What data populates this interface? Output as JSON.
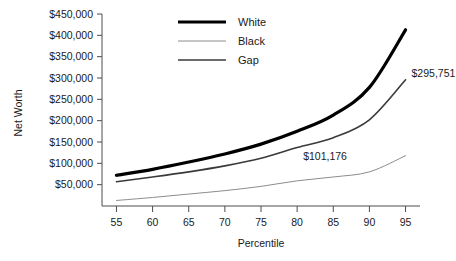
{
  "chart_data": {
    "type": "line",
    "title": "",
    "xlabel": "Percentile",
    "ylabel": "Net Worth",
    "x": [
      55,
      60,
      65,
      70,
      75,
      80,
      85,
      90,
      95
    ],
    "xlim": [
      53,
      97
    ],
    "ylim": [
      0,
      450000
    ],
    "xticks": [
      "55",
      "60",
      "65",
      "70",
      "75",
      "80",
      "85",
      "90",
      "95"
    ],
    "yticks": [
      "$50,000",
      "$100,000",
      "$150,000",
      "$200,000",
      "$250,000",
      "$300,000",
      "$350,000",
      "$400,000",
      "$450,000"
    ],
    "ytick_values": [
      50000,
      100000,
      150000,
      200000,
      250000,
      300000,
      350000,
      400000,
      450000
    ],
    "grid": false,
    "legend_position": "top-center",
    "series": [
      {
        "name": "White",
        "color": "#000000",
        "width": 3.2,
        "values": [
          72000,
          86000,
          103000,
          122000,
          145000,
          175000,
          213000,
          278000,
          413000
        ]
      },
      {
        "name": "Black",
        "color": "#8c8c8c",
        "width": 1.0,
        "values": [
          13000,
          20000,
          28000,
          36000,
          46000,
          59000,
          68000,
          80000,
          118000
        ]
      },
      {
        "name": "Gap",
        "color": "#3a3a3a",
        "width": 1.6,
        "values": [
          57000,
          68000,
          80000,
          94000,
          112000,
          137000,
          160000,
          202000,
          295751
        ]
      }
    ],
    "annotations": [
      {
        "label": "$295,751",
        "x": 95,
        "y": 295751,
        "series": "Gap"
      },
      {
        "label": "$101,176",
        "x": 80,
        "y": 101176,
        "series": "Gap"
      }
    ]
  }
}
